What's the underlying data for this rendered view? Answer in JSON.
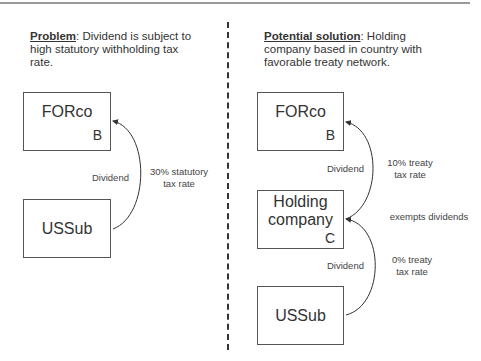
{
  "left_panel": {
    "heading_label": "Problem",
    "heading_text_line1": ":  Dividend is subject to",
    "heading_text_line2": "high statutory withholding tax",
    "heading_text_line3": "rate.",
    "top_box": {
      "name": "FORco",
      "letter": "B"
    },
    "bottom_box": {
      "name": "USSub"
    },
    "arrow_label": "Dividend",
    "rate_label_line1": "30% statutory",
    "rate_label_line2": "tax rate"
  },
  "right_panel": {
    "heading_label": "Potential solution",
    "heading_text_line1": ":  Holding",
    "heading_text_line2": "company based in country with",
    "heading_text_line3": "favorable treaty network.",
    "top_box": {
      "name": "FORco",
      "letter": "B"
    },
    "middle_box": {
      "name_line1": "Holding",
      "name_line2": "company",
      "letter": "C"
    },
    "bottom_box": {
      "name": "USSub"
    },
    "upper_arrow_label": "Dividend",
    "upper_rate_line1": "10% treaty",
    "upper_rate_line2": "tax rate",
    "exempt_label": "exempts dividends",
    "lower_arrow_label": "Dividend",
    "lower_rate_line1": "0% treaty",
    "lower_rate_line2": "tax rate"
  },
  "colors": {
    "line": "#333333",
    "box_border": "#555555",
    "top_rule": "#9a9a9a"
  }
}
